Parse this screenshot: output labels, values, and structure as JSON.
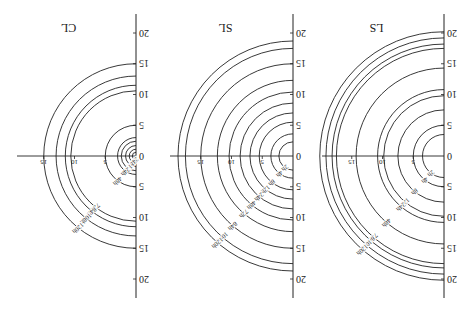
{
  "figure": {
    "orientation": "rotated-180",
    "line_color": "#222222",
    "background": "#ffffff"
  },
  "chart_data": [
    {
      "type": "line",
      "title": "LS",
      "description": "Quarter-circle-like contour rings (left half ellipses) per time step",
      "axes": {
        "vertical": {
          "ticks": [
            20,
            15,
            10,
            5,
            0,
            5,
            10,
            15,
            20
          ],
          "range": [
            -23,
            23
          ]
        },
        "horizontal": {
          "ticks": [
            0,
            5,
            10,
            15
          ],
          "range": [
            0,
            20.5
          ]
        }
      },
      "series": [
        {
          "name": "2h",
          "radius": 3.5
        },
        {
          "name": "4h",
          "radius": 5.0
        },
        {
          "name": "8h",
          "radius": 7.5
        },
        {
          "name": "12h",
          "radius": 9.8
        },
        {
          "name": "24h",
          "radius": 10.8
        },
        {
          "name": "48h",
          "radius": 14.3
        },
        {
          "name": "72h",
          "radius": 17.5
        },
        {
          "name": "84h",
          "radius": 18.2
        },
        {
          "name": "108h",
          "radius": 19.2
        },
        {
          "name": "120h",
          "radius": 20.2
        }
      ]
    },
    {
      "type": "line",
      "title": "SL",
      "axes": {
        "vertical": {
          "ticks": [
            20,
            15,
            10,
            5,
            0,
            5,
            10,
            15,
            20
          ],
          "range": [
            -23,
            23
          ]
        },
        "horizontal": {
          "ticks": [
            0,
            5,
            10,
            15
          ],
          "range": [
            0,
            20
          ]
        }
      },
      "series": [
        {
          "name": "2h",
          "radius": 2.3
        },
        {
          "name": "4h",
          "radius": 3.6
        },
        {
          "name": "8h",
          "radius": 5.5
        },
        {
          "name": "12h",
          "radius": 7.0
        },
        {
          "name": "24h",
          "radius": 8.6
        },
        {
          "name": "48h",
          "radius": 10.4
        },
        {
          "name": "72h",
          "radius": 12.3
        },
        {
          "name": "84h",
          "radius": 15.0
        },
        {
          "name": "108h",
          "radius": 17.5
        },
        {
          "name": "120h",
          "radius": 18.7
        }
      ]
    },
    {
      "type": "line",
      "title": "CL",
      "axes": {
        "vertical": {
          "ticks": [
            20,
            15,
            10,
            5,
            0,
            5,
            10,
            15,
            20
          ],
          "range": [
            -23,
            23
          ]
        },
        "horizontal": {
          "ticks": [
            0,
            5,
            10,
            15
          ],
          "range": [
            0,
            19.5
          ]
        }
      },
      "series": [
        {
          "name": "2h",
          "radius": 0.6
        },
        {
          "name": "4h",
          "radius": 1.1
        },
        {
          "name": "8h",
          "radius": 1.7
        },
        {
          "name": "12h",
          "radius": 2.4
        },
        {
          "name": "24h",
          "radius": 3.0
        },
        {
          "name": "48h",
          "radius": 5.0
        },
        {
          "name": "72h",
          "radius": 10.6
        },
        {
          "name": "84h",
          "radius": 11.5
        },
        {
          "name": "108h",
          "radius": 13.0
        },
        {
          "name": "120h",
          "radius": 15.0
        }
      ]
    }
  ]
}
